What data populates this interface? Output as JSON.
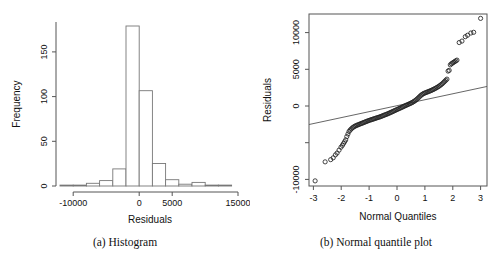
{
  "figure": {
    "panels": [
      {
        "tag": "(a)",
        "caption": "(a)  Histogram",
        "xlabel": "Residuals",
        "ylabel": "Frequency"
      },
      {
        "tag": "(b)",
        "caption": "(b)  Normal quantile plot",
        "xlabel": "Normal Quantiles",
        "ylabel": "Residuals"
      }
    ]
  },
  "chart_data": [
    {
      "type": "bar",
      "title": "",
      "subtitle": "",
      "xlabel": "Residuals",
      "ylabel": "Frequency",
      "xlim": [
        -12000,
        15000
      ],
      "ylim": [
        0,
        178
      ],
      "grid": false,
      "legend": "none",
      "xticks": [
        -10000,
        0,
        5000,
        15000
      ],
      "xticklabels": [
        "-10000",
        "0",
        "5000",
        "15000"
      ],
      "yticks": [
        0,
        50,
        100,
        150
      ],
      "yticklabels": [
        "0",
        "50",
        "100",
        "150"
      ],
      "bin_width": 2000,
      "bin_edges": [
        -12000,
        -10000,
        -8000,
        -6000,
        -4000,
        -2000,
        0,
        2000,
        4000,
        6000,
        8000,
        10000,
        12000,
        14000
      ],
      "categories": [
        "-12000 to -10000",
        "-10000 to -8000",
        "-8000 to -6000",
        "-6000 to -4000",
        "-4000 to -2000",
        "-2000 to 0",
        "0 to 2000",
        "2000 to 4000",
        "4000 to 6000",
        "6000 to 8000",
        "8000 to 10000",
        "10000 to 12000",
        "12000 to 14000"
      ],
      "values": [
        1,
        1,
        3,
        6,
        19,
        178,
        106,
        25,
        7,
        2,
        4,
        1,
        1
      ]
    },
    {
      "type": "scatter",
      "title": "",
      "subtitle": "",
      "xlabel": "Normal Quantiles",
      "ylabel": "Residuals",
      "xlim": [
        -3.2,
        3.2
      ],
      "ylim": [
        -11000,
        12500
      ],
      "grid": false,
      "legend": "none",
      "marker": "open-circle",
      "xticks": [
        -3,
        -2,
        -1,
        0,
        1,
        2,
        3
      ],
      "xticklabels": [
        "-3",
        "-2",
        "-1",
        "0",
        "1",
        "2",
        "3"
      ],
      "yticks": [
        -10000,
        -5000,
        0,
        5000,
        10000
      ],
      "yticklabels": [
        "-10000",
        "",
        "0",
        "5000",
        "10000"
      ],
      "reference_line": {
        "x": [
          -3.2,
          3.2
        ],
        "y": [
          -2600,
          2600
        ],
        "slope": 812,
        "intercept": 0
      },
      "points": [
        [
          -2.98,
          -10300
        ],
        [
          -2.62,
          -7700
        ],
        [
          -2.42,
          -7400
        ],
        [
          -2.33,
          -7150
        ],
        [
          -2.25,
          -6750
        ],
        [
          -2.19,
          -6500
        ],
        [
          -2.12,
          -6100
        ],
        [
          -2.05,
          -5700
        ],
        [
          -2.0,
          -5450
        ],
        [
          -1.96,
          -5200
        ],
        [
          -1.92,
          -4950
        ],
        [
          -1.88,
          -4700
        ],
        [
          -1.84,
          -4250
        ],
        [
          -1.8,
          -3900
        ],
        [
          -1.76,
          -3550
        ],
        [
          -1.72,
          -3350
        ],
        [
          -1.68,
          -3200
        ],
        [
          -1.64,
          -3050
        ],
        [
          -1.6,
          -2950
        ],
        [
          -1.56,
          -2850
        ],
        [
          -1.52,
          -2780
        ],
        [
          -1.48,
          -2700
        ],
        [
          -1.44,
          -2650
        ],
        [
          -1.4,
          -2580
        ],
        [
          -1.36,
          -2520
        ],
        [
          -1.32,
          -2460
        ],
        [
          -1.28,
          -2400
        ],
        [
          -1.24,
          -2340
        ],
        [
          -1.2,
          -2280
        ],
        [
          -1.16,
          -2220
        ],
        [
          -1.12,
          -2160
        ],
        [
          -1.08,
          -2100
        ],
        [
          -1.04,
          -2040
        ],
        [
          -1.0,
          -1990
        ],
        [
          -0.96,
          -1940
        ],
        [
          -0.92,
          -1890
        ],
        [
          -0.88,
          -1840
        ],
        [
          -0.84,
          -1790
        ],
        [
          -0.8,
          -1740
        ],
        [
          -0.76,
          -1690
        ],
        [
          -0.72,
          -1640
        ],
        [
          -0.68,
          -1590
        ],
        [
          -0.64,
          -1540
        ],
        [
          -0.6,
          -1480
        ],
        [
          -0.56,
          -1420
        ],
        [
          -0.52,
          -1360
        ],
        [
          -0.48,
          -1300
        ],
        [
          -0.44,
          -1240
        ],
        [
          -0.4,
          -1180
        ],
        [
          -0.36,
          -1120
        ],
        [
          -0.32,
          -1050
        ],
        [
          -0.28,
          -980
        ],
        [
          -0.24,
          -910
        ],
        [
          -0.2,
          -840
        ],
        [
          -0.16,
          -770
        ],
        [
          -0.12,
          -700
        ],
        [
          -0.08,
          -630
        ],
        [
          -0.04,
          -560
        ],
        [
          0.0,
          -490
        ],
        [
          0.04,
          -420
        ],
        [
          0.08,
          -350
        ],
        [
          0.12,
          -280
        ],
        [
          0.16,
          -210
        ],
        [
          0.2,
          -140
        ],
        [
          0.24,
          -70
        ],
        [
          0.28,
          0
        ],
        [
          0.32,
          70
        ],
        [
          0.36,
          140
        ],
        [
          0.4,
          210
        ],
        [
          0.44,
          280
        ],
        [
          0.48,
          350
        ],
        [
          0.52,
          430
        ],
        [
          0.56,
          520
        ],
        [
          0.6,
          620
        ],
        [
          0.64,
          730
        ],
        [
          0.68,
          860
        ],
        [
          0.72,
          1000
        ],
        [
          0.76,
          1150
        ],
        [
          0.8,
          1300
        ],
        [
          0.84,
          1430
        ],
        [
          0.88,
          1540
        ],
        [
          0.92,
          1630
        ],
        [
          0.96,
          1700
        ],
        [
          1.0,
          1760
        ],
        [
          1.04,
          1820
        ],
        [
          1.08,
          1880
        ],
        [
          1.12,
          1940
        ],
        [
          1.16,
          2000
        ],
        [
          1.2,
          2070
        ],
        [
          1.24,
          2140
        ],
        [
          1.28,
          2210
        ],
        [
          1.32,
          2290
        ],
        [
          1.36,
          2370
        ],
        [
          1.4,
          2460
        ],
        [
          1.44,
          2550
        ],
        [
          1.48,
          2650
        ],
        [
          1.52,
          2760
        ],
        [
          1.56,
          2880
        ],
        [
          1.6,
          3000
        ],
        [
          1.64,
          3150
        ],
        [
          1.68,
          3300
        ],
        [
          1.72,
          3450
        ],
        [
          1.76,
          3600
        ],
        [
          1.8,
          4700
        ],
        [
          1.84,
          4800
        ],
        [
          1.88,
          5550
        ],
        [
          1.92,
          5700
        ],
        [
          1.96,
          5800
        ],
        [
          2.0,
          5900
        ],
        [
          2.04,
          6000
        ],
        [
          2.08,
          6100
        ],
        [
          2.12,
          6200
        ],
        [
          2.2,
          8600
        ],
        [
          2.3,
          8800
        ],
        [
          2.42,
          9400
        ],
        [
          2.5,
          9600
        ],
        [
          2.62,
          9900
        ],
        [
          2.72,
          10000
        ],
        [
          2.97,
          11900
        ]
      ]
    }
  ]
}
